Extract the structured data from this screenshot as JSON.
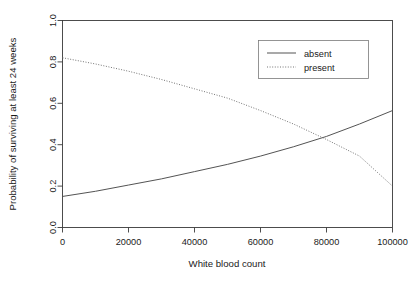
{
  "chart_data": {
    "type": "line",
    "title": "",
    "xlabel": "White blood count",
    "ylabel": "Probability of surviving at least 24 weeks",
    "xlim": [
      0,
      100000
    ],
    "ylim": [
      0.0,
      1.0
    ],
    "grid": false,
    "legend_position": "top-right",
    "xticks": [
      0,
      20000,
      40000,
      60000,
      80000,
      100000
    ],
    "xticklabels": [
      "0",
      "20000",
      "40000",
      "60000",
      "80000",
      "100000"
    ],
    "yticks": [
      0.0,
      0.2,
      0.4,
      0.6,
      0.8,
      1.0
    ],
    "yticklabels": [
      "0.0",
      "0.2",
      "0.4",
      "0.6",
      "0.8",
      "1.0"
    ],
    "x": [
      0,
      10000,
      20000,
      30000,
      40000,
      50000,
      60000,
      70000,
      80000,
      90000,
      100000
    ],
    "series": [
      {
        "name": "absent",
        "style": "solid",
        "color": "#4a4a4a",
        "values": [
          0.15,
          0.175,
          0.205,
          0.235,
          0.27,
          0.305,
          0.345,
          0.39,
          0.44,
          0.5,
          0.565
        ]
      },
      {
        "name": "present",
        "style": "dotted",
        "color": "#6e6e6e",
        "values": [
          0.82,
          0.79,
          0.755,
          0.715,
          0.67,
          0.625,
          0.565,
          0.5,
          0.425,
          0.345,
          0.2
        ]
      }
    ]
  },
  "legend": {
    "entries": [
      {
        "label": "absent"
      },
      {
        "label": "present"
      }
    ]
  },
  "axes": {
    "x_title": "White blood count",
    "y_title": "Probability of surviving at least 24 weeks"
  }
}
